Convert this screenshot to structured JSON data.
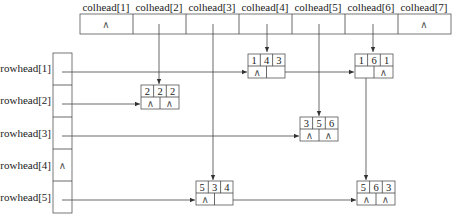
{
  "diagram": {
    "type": "orthogonal-linked-list",
    "colheads": [
      {
        "label": "colhead[1]",
        "value": "∧"
      },
      {
        "label": "colhead[2]",
        "value": ""
      },
      {
        "label": "colhead[3]",
        "value": ""
      },
      {
        "label": "colhead[4]",
        "value": ""
      },
      {
        "label": "colhead[5]",
        "value": ""
      },
      {
        "label": "colhead[6]",
        "value": ""
      },
      {
        "label": "colhead[7]",
        "value": "∧"
      }
    ],
    "rowheads": [
      {
        "label": "rowhead[1]",
        "value": ""
      },
      {
        "label": "rowhead[2]",
        "value": ""
      },
      {
        "label": "rowhead[3]",
        "value": ""
      },
      {
        "label": "rowhead[4]",
        "value": "∧"
      },
      {
        "label": "rowhead[5]",
        "value": ""
      }
    ],
    "nodes": [
      {
        "id": "n143",
        "row": "1",
        "col": "4",
        "val": "3",
        "down": "∧",
        "right": ""
      },
      {
        "id": "n161",
        "row": "1",
        "col": "6",
        "val": "1",
        "down": "",
        "right": "∧"
      },
      {
        "id": "n222",
        "row": "2",
        "col": "2",
        "val": "2",
        "down": "∧",
        "right": "∧"
      },
      {
        "id": "n356",
        "row": "3",
        "col": "5",
        "val": "6",
        "down": "∧",
        "right": "∧"
      },
      {
        "id": "n534",
        "row": "5",
        "col": "3",
        "val": "4",
        "down": "∧",
        "right": ""
      },
      {
        "id": "n563",
        "row": "5",
        "col": "6",
        "val": "3",
        "down": "∧",
        "right": "∧"
      }
    ]
  }
}
